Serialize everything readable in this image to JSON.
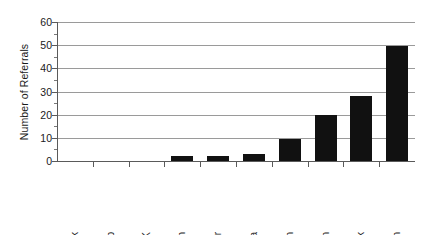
{
  "chart_data": {
    "type": "bar",
    "title": "",
    "subtitle": "",
    "xlabel": "",
    "ylabel": "Number of Referrals",
    "categories": [
      "Avoid wrk",
      "Avoid p",
      "DK",
      "Ob itm",
      "Other",
      "Avoid a",
      "Ob a attn",
      "Unknown",
      "Avoid task",
      "Ob p attn"
    ],
    "values": [
      0,
      0,
      0,
      2,
      2,
      3,
      9.5,
      20,
      28,
      49.5
    ],
    "ylim": [
      0,
      60
    ],
    "ytick_labels": [
      "0",
      "10",
      "20",
      "30",
      "40",
      "50",
      "60"
    ],
    "ytick_values": [
      0,
      10,
      20,
      30,
      40,
      50,
      60
    ],
    "ytick_minor_values": [
      5,
      15,
      25,
      35,
      45,
      55
    ],
    "grid": true,
    "grid_axis": "y",
    "legend": false,
    "legend_position": "none",
    "bar_color": "#111111",
    "gridline_color": "#9a9a9a",
    "axis_color": "#5a5a5a",
    "background_color": "#ffffff",
    "xtick_label_rotation": 90,
    "ylabel_rotation": 90
  }
}
